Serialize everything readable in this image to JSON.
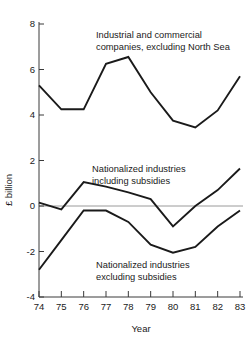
{
  "chart_data": {
    "type": "line",
    "title": "",
    "xlabel": "Year",
    "ylabel": "£ billion",
    "x": [
      74,
      75,
      76,
      77,
      78,
      79,
      80,
      81,
      82,
      83
    ],
    "xtick_labels": [
      "74",
      "75",
      "76",
      "77",
      "78",
      "79",
      "80",
      "81",
      "82",
      "83"
    ],
    "ytick_labels": [
      "-4",
      "-2",
      "0",
      "2",
      "4",
      "6",
      "8"
    ],
    "yticks": [
      -4,
      -2,
      0,
      2,
      4,
      6,
      8
    ],
    "ylim": [
      -4,
      8
    ],
    "xlim": [
      74,
      83
    ],
    "grid": false,
    "legend": "inline-annotations",
    "zero_line": true,
    "series": [
      {
        "name": "Industrial and commercial companies, excluding North Sea",
        "values": [
          5.3,
          4.25,
          4.25,
          6.25,
          6.55,
          5.0,
          3.75,
          3.45,
          4.2,
          5.7
        ]
      },
      {
        "name": "Nationalized industries including subsidies",
        "values": [
          0.15,
          -0.15,
          1.05,
          0.85,
          0.6,
          0.3,
          -0.9,
          0.0,
          0.7,
          1.65
        ]
      },
      {
        "name": "Nationalized industries excluding subsidies",
        "values": [
          -2.8,
          -1.5,
          -0.2,
          -0.2,
          -0.7,
          -1.7,
          -2.05,
          -1.8,
          -0.9,
          -0.2
        ]
      }
    ],
    "annotations": [
      {
        "id": "annot-industrial",
        "lines": [
          "Industrial and commercial",
          "companies, excluding North Sea"
        ],
        "x": 96,
        "y": 38
      },
      {
        "id": "annot-nationalized-including",
        "lines": [
          "Nationalized industries",
          "including subsidies"
        ],
        "x": 92,
        "y": 172
      },
      {
        "id": "annot-nationalized-excluding",
        "lines": [
          "Nationalized industries",
          "excluding subsidies"
        ],
        "x": 96,
        "y": 268
      }
    ]
  }
}
